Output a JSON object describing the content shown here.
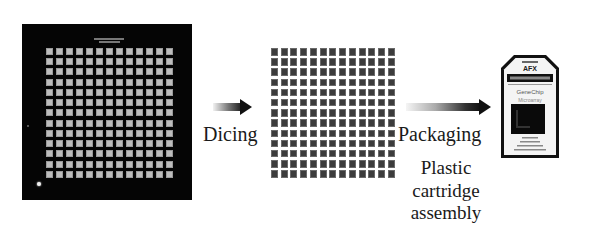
{
  "diagram": {
    "stages": [
      {
        "name": "wafer",
        "description": "Wafer with 13x13 array of chips",
        "grid_rows": 13,
        "grid_cols": 13
      },
      {
        "name": "diced-chips",
        "description": "Individual diced chips",
        "grid_rows": 13,
        "grid_cols": 13
      },
      {
        "name": "cartridge",
        "description": "Packaged GeneChip cartridge"
      }
    ],
    "arrows": [
      {
        "from": "wafer",
        "to": "diced-chips",
        "label": "Dicing"
      },
      {
        "from": "diced-chips",
        "to": "cartridge",
        "label": "Packaging"
      }
    ],
    "labels": {
      "dicing": "Dicing",
      "packaging": "Packaging",
      "cartridge_caption": "Plastic cartridge assembly"
    },
    "cartridge": {
      "brand": "AFFYMETRIX",
      "product": "GeneChip",
      "subtitle": "Microarray"
    },
    "colors": {
      "background": "#ffffff",
      "wafer": "#050505",
      "wafer_die": "#bdbdbd",
      "diced_die": "#3c3c3c",
      "text": "#1a1a1a"
    }
  }
}
